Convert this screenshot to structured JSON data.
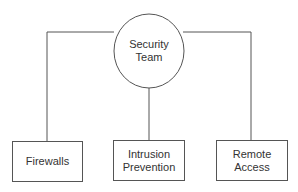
{
  "diagram": {
    "root": {
      "label_line1": "Security",
      "label_line2": "Team",
      "shape": "circle"
    },
    "children": [
      {
        "label_line1": "Firewalls",
        "label_line2": ""
      },
      {
        "label_line1": "Intrusion",
        "label_line2": "Prevention"
      },
      {
        "label_line1": "Remote Access",
        "label_line2": ""
      }
    ],
    "colors": {
      "line": "#555555",
      "text": "#333333",
      "background": "#ffffff"
    }
  }
}
